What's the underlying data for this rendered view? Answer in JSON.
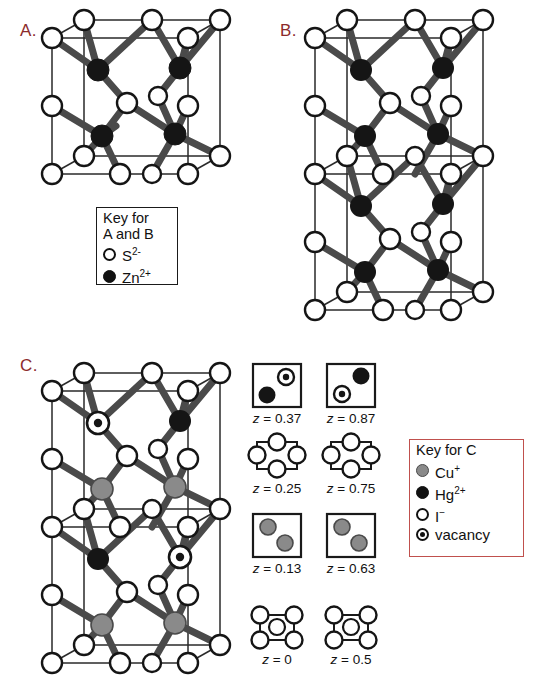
{
  "figure": {
    "type": "crystal-structure-diagram",
    "panels": [
      {
        "id": "A",
        "label": "A.",
        "label_color": "#8c2b2b",
        "description": "zinc blende (sphalerite) cubic unit cell of ZnS"
      },
      {
        "id": "B",
        "label": "B.",
        "label_color": "#8c2b2b",
        "description": "doubled tetragonal cell of ZnS"
      },
      {
        "id": "C",
        "label": "C.",
        "label_color": "#8c2b2b",
        "description": "Cu2HgI4 superstructure cell"
      }
    ]
  },
  "key_ab": {
    "title_line1": "Key for",
    "title_line2": "A and B",
    "border_color": "#1a1a1a",
    "items": [
      {
        "marker": "open-circle",
        "label": "S",
        "charge": "2-"
      },
      {
        "marker": "filled-circle",
        "label": "Zn",
        "charge": "2+"
      }
    ]
  },
  "key_c": {
    "title": "Key for C",
    "border_color": "#c0504d",
    "items": [
      {
        "marker": "gray-circle",
        "label": "Cu",
        "charge": "+"
      },
      {
        "marker": "filled-circle",
        "label": "Hg",
        "charge": "2+"
      },
      {
        "marker": "open-circle",
        "label": "I",
        "charge": "−"
      },
      {
        "marker": "vacancy-circle",
        "label": "vacancy",
        "charge": ""
      }
    ]
  },
  "z_layers": [
    {
      "caption_var": "z",
      "caption": "z = 0.37",
      "value": "0.37",
      "style": "square",
      "atoms": [
        {
          "type": "vacancy",
          "x": 0.7,
          "y": 0.3
        },
        {
          "type": "filled",
          "x": 0.28,
          "y": 0.72
        }
      ]
    },
    {
      "caption_var": "z",
      "caption": "z = 0.87",
      "value": "0.87",
      "style": "square",
      "atoms": [
        {
          "type": "filled",
          "x": 0.72,
          "y": 0.28
        },
        {
          "type": "vacancy",
          "x": 0.3,
          "y": 0.7
        }
      ]
    },
    {
      "caption_var": "z",
      "caption": "z = 0.25",
      "value": "0.25",
      "style": "edge-midpoints",
      "atoms": [
        {
          "type": "open",
          "x": 0.5,
          "y": 0.0
        },
        {
          "type": "open",
          "x": 1.0,
          "y": 0.5
        },
        {
          "type": "open",
          "x": 0.5,
          "y": 1.0
        },
        {
          "type": "open",
          "x": 0.0,
          "y": 0.5
        }
      ]
    },
    {
      "caption_var": "z",
      "caption": "z = 0.75",
      "value": "0.75",
      "style": "edge-midpoints",
      "atoms": [
        {
          "type": "open",
          "x": 0.5,
          "y": 0.0
        },
        {
          "type": "open",
          "x": 1.0,
          "y": 0.5
        },
        {
          "type": "open",
          "x": 0.5,
          "y": 1.0
        },
        {
          "type": "open",
          "x": 0.0,
          "y": 0.5
        }
      ]
    },
    {
      "caption_var": "z",
      "caption": "z = 0.13",
      "value": "0.13",
      "style": "square",
      "atoms": [
        {
          "type": "gray",
          "x": 0.3,
          "y": 0.28
        },
        {
          "type": "gray",
          "x": 0.68,
          "y": 0.66
        }
      ]
    },
    {
      "caption_var": "z",
      "caption": "z = 0.63",
      "value": "0.63",
      "style": "square",
      "atoms": [
        {
          "type": "gray",
          "x": 0.3,
          "y": 0.28
        },
        {
          "type": "gray",
          "x": 0.68,
          "y": 0.66
        }
      ]
    },
    {
      "caption_var": "z",
      "caption": "z = 0",
      "value": "0",
      "style": "corners-center",
      "atoms": [
        {
          "type": "open",
          "x": 0,
          "y": 0
        },
        {
          "type": "open",
          "x": 1,
          "y": 0
        },
        {
          "type": "open",
          "x": 0,
          "y": 1
        },
        {
          "type": "open",
          "x": 1,
          "y": 1
        },
        {
          "type": "open",
          "x": 0.5,
          "y": 0.5
        }
      ]
    },
    {
      "caption_var": "z",
      "caption": "z = 0.5",
      "value": "0.5",
      "style": "corners-center",
      "atoms": [
        {
          "type": "open",
          "x": 0,
          "y": 0
        },
        {
          "type": "open",
          "x": 1,
          "y": 0
        },
        {
          "type": "open",
          "x": 0,
          "y": 1
        },
        {
          "type": "open",
          "x": 1,
          "y": 1
        },
        {
          "type": "open",
          "x": 0.5,
          "y": 0.5
        }
      ]
    }
  ],
  "colors": {
    "anion_open": "#ffffff",
    "cation_filled": "#151515",
    "cation_gray": "#8a8a8a",
    "bond": "#4a4a4a",
    "cell_edge": "#2a2a2a",
    "label_red": "#8c2b2b",
    "key_c_border": "#c0504d"
  }
}
